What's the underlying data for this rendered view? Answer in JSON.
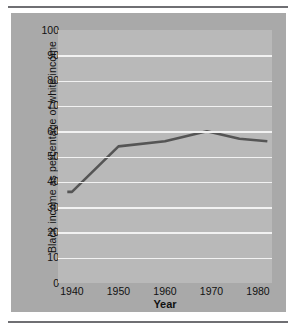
{
  "chart_data": {
    "type": "line",
    "title": "",
    "xlabel": "Year",
    "ylabel": "Black income as  percentage of white income",
    "xlim": [
      1937,
      1983
    ],
    "ylim": [
      0,
      100
    ],
    "grid": true,
    "legend": "none",
    "yticks": [
      0,
      10,
      20,
      30,
      40,
      50,
      60,
      70,
      80,
      90,
      100
    ],
    "ytick_labels": [
      "0",
      "10",
      "20",
      "30",
      "40",
      "50",
      "60",
      "70",
      "80",
      "90",
      "100"
    ],
    "gridline_values": [
      10,
      20,
      30,
      40,
      50,
      60,
      70,
      80,
      90
    ],
    "xticks": [
      1940,
      1950,
      1960,
      1970,
      1980
    ],
    "xtick_labels": [
      "1940",
      "1950",
      "1960",
      "1970",
      "1980"
    ],
    "line_color": "#555555",
    "plot_background": "#b9b9b9",
    "panel_background": "#a9a9a9",
    "gridline_color": "#f2f2f2",
    "x": [
      1939,
      1940,
      1950,
      1960,
      1969,
      1976,
      1982
    ],
    "values": [
      36,
      36,
      54,
      56,
      60,
      57,
      56
    ],
    "series": [
      {
        "name": "Black income as percentage of white income",
        "points": [
          {
            "x": 1939,
            "y": 36
          },
          {
            "x": 1940,
            "y": 36
          },
          {
            "x": 1950,
            "y": 54
          },
          {
            "x": 1960,
            "y": 56
          },
          {
            "x": 1969,
            "y": 60
          },
          {
            "x": 1976,
            "y": 57
          },
          {
            "x": 1982,
            "y": 56
          }
        ]
      }
    ]
  }
}
